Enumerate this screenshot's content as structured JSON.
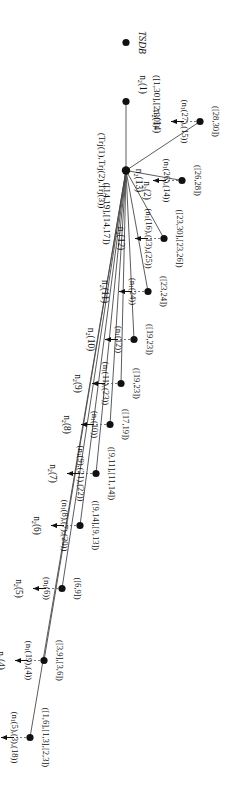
{
  "figure": {
    "type": "tree-diagram",
    "root_label": "TSDB",
    "root": {
      "id": "n2(1)",
      "name_html": "n<sub>2</sub>(1)",
      "interval": "([1,30],[2,30])"
    },
    "hub": {
      "id": "n2(2)",
      "name_html": "n<sub>2</sub>(2)",
      "trajectories": "(Trj(1),Trj(2),Trj(3))",
      "interval": "([14,19],[14,17])"
    },
    "leaves": [
      {
        "id": "n2(3)",
        "name_html": "n<sub>2</sub>(3)",
        "interval": "([1,6],[1,3],[2,3])",
        "members": "(n<sub>1</sub>(5),(3),(18))"
      },
      {
        "id": "n2(4)",
        "name_html": "n<sub>2</sub>(4)",
        "interval": "([3,9],[3,6])",
        "members": "(n<sub>1</sub>(19),(4))"
      },
      {
        "id": "n2(5)",
        "name_html": "n<sub>2</sub>(5)",
        "interval": "([6,9])",
        "members": "(n<sub>1</sub>(6))"
      },
      {
        "id": "n2(6)",
        "name_html": "n<sub>2</sub>(6)",
        "interval": "([9,14],[9,13])",
        "members": "(n<sub>1</sub>(8),(7),(20))"
      },
      {
        "id": "n2(7)",
        "name_html": "n<sub>2</sub>(7)",
        "interval": "([9,11],[11,14])",
        "members": "(n<sub>1</sub>(9),(21),(22))"
      },
      {
        "id": "n2(8)",
        "name_html": "n<sub>2</sub>(8)",
        "interval": "([17,19])",
        "members": "(n<sub>1</sub>(10))"
      },
      {
        "id": "n2(9)",
        "name_html": "n<sub>2</sub>(9)",
        "interval": "([19,23])",
        "members": "(n<sub>1</sub>(11),(23))"
      },
      {
        "id": "n2(10)",
        "name_html": "n<sub>2</sub>(10)",
        "interval": "([19,23])",
        "members": "(n<sub>1</sub>(12))"
      },
      {
        "id": "n2(11)",
        "name_html": "n<sub>2</sub>(11)",
        "interval": "([23,24])",
        "members": "(n<sub>1</sub>(24))"
      },
      {
        "id": "n2(12)",
        "name_html": "n<sub>2</sub>(12)",
        "interval": "([23,30],[23,26])",
        "members": "(n<sub>1</sub>(16),(13),(25))"
      },
      {
        "id": "n2(13)",
        "name_html": "n<sub>2</sub>(13)",
        "interval": "([26,28])",
        "members": "(n<sub>1</sub>(26),(14))"
      },
      {
        "id": "n2(14)",
        "name_html": "n<sub>2</sub>(14)",
        "interval": "([28,30])",
        "members": "(n<sub>1</sub>(27),(15))"
      }
    ],
    "colors": {
      "node": "#111111",
      "edge": "#4a4a4a",
      "background": "#ffffff"
    }
  }
}
